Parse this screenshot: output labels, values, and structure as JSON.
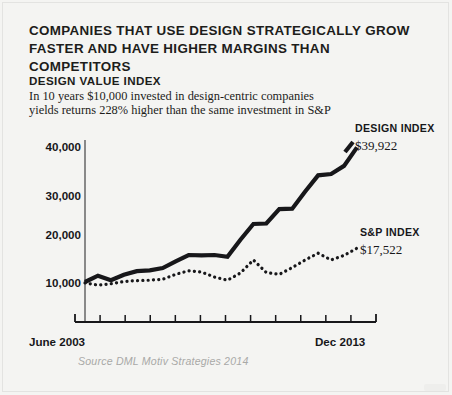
{
  "headline": {
    "line1": "COMPANIES THAT USE DESIGN STRATEGICALLY GROW",
    "line2": "FASTER AND HAVE HIGHER MARGINS THAN COMPETITORS"
  },
  "subhead": {
    "title": "DESIGN VALUE INDEX",
    "line1": "In 10 years $10,000 invested in design-centric companies",
    "line2": "yields returns 228% higher than the same investment in S&P"
  },
  "source": "Source DML Motiv Strategies 2014",
  "colors": {
    "ink": "#17171a",
    "background": "#f4f4f2",
    "source_text": "#a9a9a7"
  },
  "chart_data": {
    "type": "line",
    "title": "DESIGN VALUE INDEX",
    "xlabel": "",
    "ylabel": "",
    "grid": false,
    "legend_position": "right-inline",
    "xlim": [
      0,
      21
    ],
    "ylim": [
      0,
      45000
    ],
    "yticks": [
      10000,
      20000,
      30000,
      40000
    ],
    "ytick_labels": [
      "10,000",
      "20,000",
      "30,000",
      "40,000"
    ],
    "xtick_labels": [
      "June 2003",
      "Dec 2013"
    ],
    "x_tick_count": 11,
    "x": [
      0,
      1,
      2,
      3,
      4,
      5,
      6,
      7,
      8,
      9,
      10,
      11,
      12,
      13,
      14,
      15,
      16,
      17,
      18,
      19,
      20,
      21
    ],
    "series": [
      {
        "name": "DESIGN INDEX",
        "style": "solid",
        "end_label": "$39,922",
        "end_value": 39922,
        "values": [
          10000,
          11400,
          10400,
          11600,
          12400,
          12600,
          13100,
          14600,
          16000,
          15900,
          16000,
          15600,
          19400,
          22900,
          23000,
          26200,
          26300,
          30100,
          33700,
          34000,
          35800,
          39922
        ]
      },
      {
        "name": "S&P INDEX",
        "style": "dotted",
        "end_label": "$17,522",
        "end_value": 17522,
        "values": [
          9800,
          9300,
          9600,
          10100,
          10300,
          10400,
          10600,
          11700,
          12500,
          12200,
          11100,
          10400,
          12000,
          14900,
          12100,
          11700,
          13200,
          14900,
          16400,
          14900,
          15900,
          17522
        ]
      }
    ]
  }
}
